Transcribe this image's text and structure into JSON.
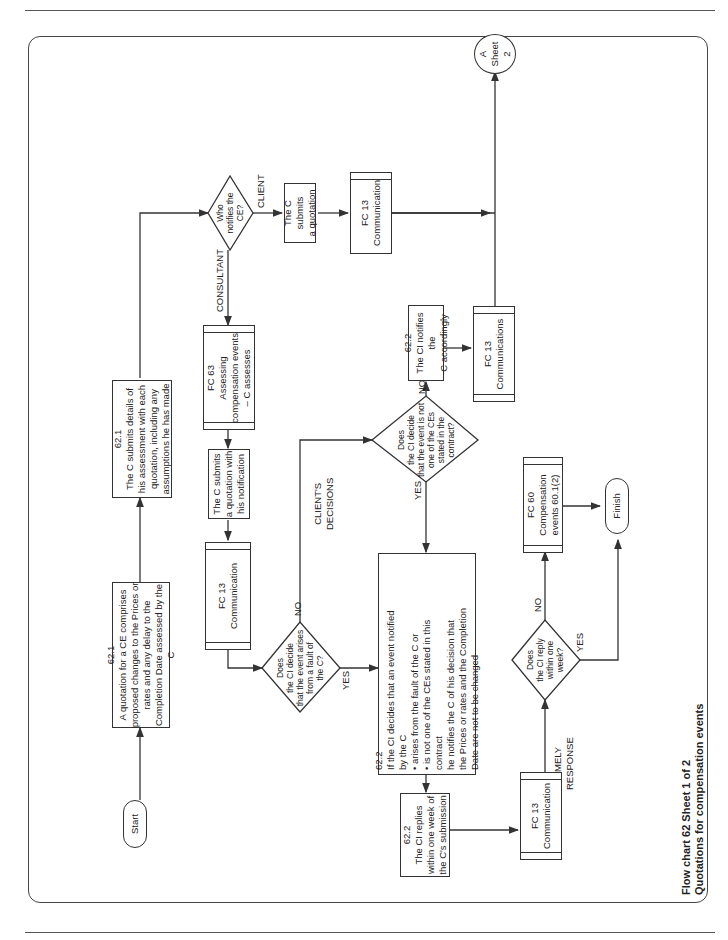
{
  "caption": {
    "line1": "Flow chart 62   Sheet 1 of 2",
    "line2": "Quotations for compensation events"
  },
  "section_labels": {
    "quotation": "QUOTATION",
    "clients_decisions": "CLIENT'S\nDECISIONS",
    "timely_response": "TIMELY\nRESPONSE"
  },
  "nodes": {
    "start": "Start",
    "quotation_621": "62.1\nA quotation for a CE comprises\nproposed changes to the Prices or\nrates and any delay to the\nCompletion Date assessed by the C",
    "assessment_621": "62.1\nThe C submits details of\nhis assessment with each\nquotation, including any\nassumptions he has made",
    "who_notifies": "Who\nnotifies the\nCE?",
    "fc63": "FC 63\nAssessing\ncompensation events\n– C assesses",
    "client_submits": "The C submits\na quotation",
    "fc13_client": "FC 13\nCommunication",
    "c_submits_with_notification": "The C submits\na quotation with\nhis notification",
    "fc13_consultant": "FC 13\nCommunication",
    "decide_fault": "Does\nthe CI decide\nthat the event arises\nfrom a fault of\nthe C?",
    "decide_not_ce": "Does\nthe CI decide\nthat the event is not\none of the CEs\nstated in the\ncontract?",
    "notify_accordingly": "62.2\nThe CI notifies the\nC accordingly",
    "fc13_communications": "FC 13\nCommunications",
    "connector_a": "A\nSheet 2",
    "decision_622": "62.2\nIf the CI decides that an event notified\nby the C\n•  arises from the fault of the C or\n•  is not one of the CEs stated in this\n    contract\nhe notifies the C of his decision that\nthe Prices or rates and the Completion\nDate are not to be changed",
    "replies_622": "62.2\nThe CI replies\nwithin one week of\nthe C's submission",
    "fc13_reply": "FC 13\nCommunication",
    "reply_within_week": "Does\nthe CI reply\nwithin one\nweek?",
    "fc60": "FC 60\nCompensation\nevents 60.1(2)",
    "finish": "Finish"
  },
  "edge_labels": {
    "consultant": "CONSULTANT",
    "client": "CLIENT",
    "no1": "NO",
    "yes1": "YES",
    "no2": "NO",
    "yes2": "YES",
    "no3": "NO",
    "yes3": "YES"
  },
  "colors": {
    "line": "#333333",
    "frame": "#444444"
  }
}
